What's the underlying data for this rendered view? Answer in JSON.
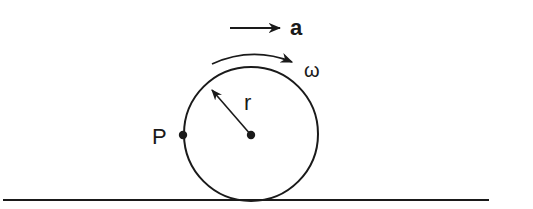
{
  "diagram": {
    "labels": {
      "acceleration": "a",
      "angular_velocity": "ω",
      "radius": "r",
      "point": "P"
    },
    "elements": {
      "wheel": {
        "cx": 251,
        "cy": 134,
        "r": 67
      },
      "center_dot": {
        "cx": 251,
        "cy": 135
      },
      "point_p": {
        "cx": 182,
        "cy": 135
      },
      "ground": {
        "x1": 3,
        "x2": 489,
        "y": 200
      },
      "acceleration_arrow": {
        "x1": 230,
        "x2": 280,
        "y": 28
      },
      "radius_arrow": {
        "from": [
          251,
          135
        ],
        "to": [
          211,
          89
        ]
      }
    },
    "colors": {
      "stroke": "#1a1a1a",
      "background": "#ffffff"
    }
  }
}
